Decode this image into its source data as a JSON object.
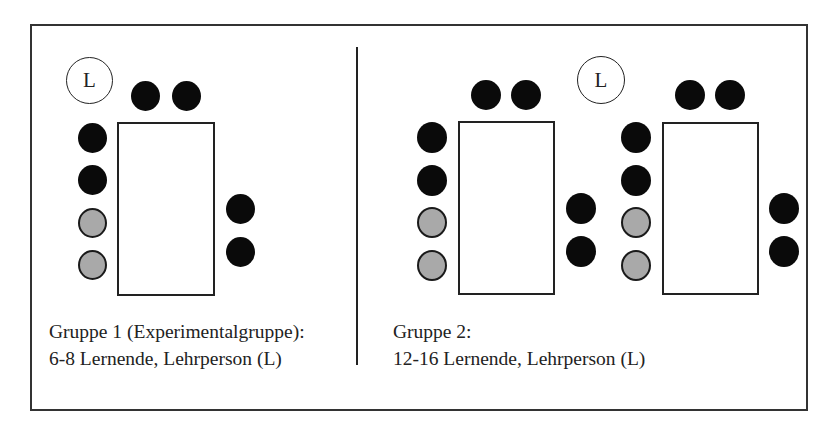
{
  "diagram": {
    "type": "seating-arrangement",
    "colors": {
      "learner": "#0a0a0a",
      "learner_highlight": "#a9a9a9",
      "teacher_fill": "#ffffff",
      "stroke": "#222222"
    },
    "legend_symbols": {
      "teacher_label": "L"
    },
    "group1": {
      "caption_line1": "Gruppe 1 (Experimentalgruppe):",
      "caption_line2": "6-8 Lernende, Lehrperson (L)",
      "teacher_label": "L",
      "tables": 1,
      "seats": {
        "top": 2,
        "left": 4,
        "left_gray": 2,
        "right": 2
      }
    },
    "group2": {
      "caption_line1": "Gruppe 2:",
      "caption_line2": "12-16 Lernende, Lehrperson (L)",
      "teacher_label": "L",
      "tables": 2,
      "seats_per_table": {
        "top": 2,
        "left": 4,
        "left_gray": 2,
        "right": 2
      }
    }
  }
}
